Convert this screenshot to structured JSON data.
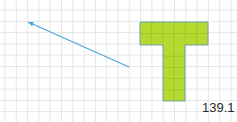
{
  "figure": {
    "label": "139.1",
    "grid": {
      "cell_size": 11.3,
      "origin_x": 5,
      "origin_y": 10,
      "cols": 21,
      "rows": 10,
      "color": "#e6e6e6"
    },
    "arrow": {
      "from": [
        129,
        67
      ],
      "to": [
        28,
        22
      ],
      "color": "#4aa8d8",
      "head_at": "to"
    },
    "t_shape": {
      "fill": "#b5d92e",
      "stroke": "#6fa0b0",
      "inner_grid": "#9cc426",
      "top_bar": {
        "x": 140,
        "y": 22,
        "width": 68,
        "height": 23,
        "cols": 6,
        "rows": 2
      },
      "stem": {
        "x": 163,
        "y": 45,
        "width": 22,
        "height": 56,
        "cols": 2,
        "rows": 5
      }
    }
  }
}
